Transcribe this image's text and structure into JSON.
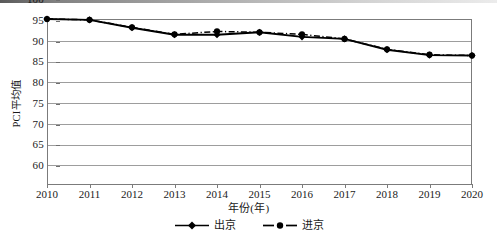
{
  "chart_data": {
    "type": "line",
    "title": "",
    "xlabel": "年份(年)",
    "ylabel": "PCI平均值",
    "categories": [
      2010,
      2011,
      2012,
      2013,
      2014,
      2015,
      2016,
      2017,
      2018,
      2019,
      2020
    ],
    "xlim": [
      2010,
      2020
    ],
    "ylim": [
      60,
      100
    ],
    "yticks": [
      60,
      65,
      70,
      75,
      80,
      85,
      90,
      95,
      100
    ],
    "xticks": [
      "2010",
      "2011",
      "2012",
      "2013",
      "2014",
      "2015",
      "2016",
      "2017",
      "2018",
      "2019",
      "2020"
    ],
    "grid": "horizontal",
    "legend_position": "bottom",
    "series": [
      {
        "name": "出京",
        "line_style": "solid",
        "marker": "diamond",
        "color": "#000000",
        "values": [
          100.0,
          99.8,
          97.9,
          96.2,
          96.2,
          96.8,
          95.7,
          95.2,
          92.6,
          91.3,
          91.2
        ]
      },
      {
        "name": "进京",
        "line_style": "dash-dot",
        "marker": "circle",
        "color": "#000000",
        "values": [
          100.0,
          99.8,
          98.0,
          96.3,
          97.0,
          96.8,
          96.3,
          95.2,
          92.7,
          91.4,
          91.2
        ]
      }
    ]
  },
  "axis": {
    "y_label": "PCI平均值",
    "x_label": "年份(年)",
    "y_tick_labels": [
      "100",
      "95",
      "90",
      "85",
      "80",
      "75",
      "70",
      "65",
      "60"
    ],
    "x_tick_labels": [
      "2010",
      "2011",
      "2012",
      "2013",
      "2014",
      "2015",
      "2016",
      "2017",
      "2018",
      "2019",
      "2020"
    ]
  },
  "legend": {
    "items": [
      {
        "label": "出京"
      },
      {
        "label": "进京"
      }
    ]
  },
  "colors": {
    "line": "#000000",
    "grid": "#9d9d9d",
    "frame": "#7b7b7b",
    "text": "#1a1a1a",
    "background": "#ffffff"
  }
}
